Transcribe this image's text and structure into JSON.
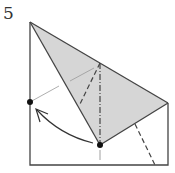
{
  "step": {
    "number": "5"
  },
  "diagram": {
    "type": "origami-fold-step",
    "elements": [
      "paper-outline",
      "shaded-flap",
      "valley-fold-line",
      "mountain-fold-line",
      "reference-line",
      "fold-arrow",
      "target-point",
      "source-point"
    ],
    "colors": {
      "line": "#444444",
      "shade": "#d6d6d6",
      "dot": "#111111",
      "guide": "#999999"
    }
  }
}
